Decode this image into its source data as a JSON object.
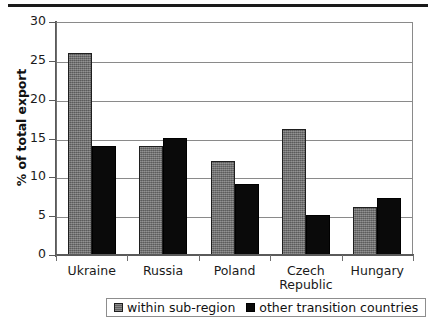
{
  "chart_data": {
    "type": "bar",
    "title": "",
    "subtitle": "",
    "xlabel": "",
    "ylabel": "% of total export",
    "categories": [
      "Ukraine",
      "Russia",
      "Poland",
      "Czech Republic",
      "Hungary"
    ],
    "category_lines": [
      [
        "Ukraine"
      ],
      [
        "Russia"
      ],
      [
        "Poland"
      ],
      [
        "Czech",
        "Republic"
      ],
      [
        "Hungary"
      ]
    ],
    "series": [
      {
        "name": "within sub-region",
        "color": "#6e6e6e",
        "values": [
          26.0,
          14.1,
          12.1,
          16.2,
          6.2
        ]
      },
      {
        "name": "other transition countries",
        "color": "#0a0a0a",
        "values": [
          14.1,
          15.1,
          9.2,
          5.2,
          7.3
        ]
      }
    ],
    "ylim": [
      0,
      30
    ],
    "ytick_values": [
      0,
      5,
      10,
      15,
      20,
      25,
      30
    ],
    "ytick_labels": [
      "0",
      "5",
      "10",
      "15",
      "20",
      "25",
      "30"
    ],
    "grid": true,
    "grid_axis": "y",
    "legend_position": "bottom",
    "legend_border": true,
    "annotations": []
  },
  "legend": {
    "items": [
      {
        "label": "within sub-region"
      },
      {
        "label": "other transition countries"
      }
    ]
  }
}
